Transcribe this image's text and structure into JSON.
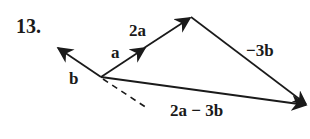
{
  "problem_number": "13.",
  "labels": {
    "a": "a",
    "two_a": "2a",
    "b": "b",
    "neg_three_b": "−3b",
    "result": "2a − 3b"
  },
  "vectors": [
    {
      "name": "b",
      "from": [
        101,
        77
      ],
      "to": [
        57,
        47
      ]
    },
    {
      "name": "a",
      "from": [
        101,
        77
      ],
      "to": [
        146,
        47
      ]
    },
    {
      "name": "2a",
      "from": [
        101,
        77
      ],
      "to": [
        191,
        17
      ]
    },
    {
      "name": "-3b",
      "from": [
        191,
        17
      ],
      "to": [
        308,
        105
      ]
    },
    {
      "name": "2a-3b",
      "from": [
        101,
        77
      ],
      "to": [
        308,
        105
      ]
    },
    {
      "name": "-b-dashed",
      "from": [
        101,
        77
      ],
      "to": [
        146,
        107
      ]
    }
  ],
  "colors": {
    "ink": "#1a1a1a",
    "background": "#ffffff"
  }
}
